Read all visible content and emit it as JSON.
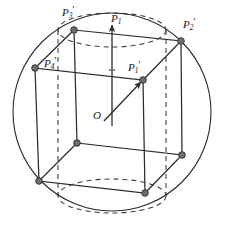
{
  "figure": {
    "background_color": "#ffffff",
    "stroke_color": "#2b2b2b",
    "vertex_fill_color": "#6e6e6e",
    "dash_color": "#3a3a3a",
    "width": 227,
    "height": 230
  },
  "labels": {
    "p3_prime": {
      "base": "P",
      "sub": "3",
      "prime": "'"
    },
    "p2_prime": {
      "base": "P",
      "sub": "2",
      "prime": "'"
    },
    "p4_prime": {
      "base": "P",
      "sub": "4",
      "prime": "'"
    },
    "p1_prime": {
      "base": "P",
      "sub": "1",
      "prime": "'"
    },
    "p1": {
      "base": "P",
      "sub": "1",
      "prime": ""
    },
    "origin": {
      "base": "O",
      "sub": "",
      "prime": ""
    }
  },
  "geometry": {
    "sphere": {
      "cx": 112,
      "cy": 112,
      "r": 99
    },
    "cylinder_ellipse": {
      "top": {
        "cx": 112,
        "cy": 30,
        "rx": 54,
        "ry": 17
      },
      "bottom": {
        "cx": 112,
        "cy": 196,
        "rx": 54,
        "ry": 17
      }
    },
    "cube_vertices": {
      "top_back_left": {
        "x": 74,
        "y": 30,
        "label": "p3_prime"
      },
      "top_back_right": {
        "x": 181,
        "y": 41,
        "label": "p2_prime"
      },
      "top_front_left": {
        "x": 35,
        "y": 68,
        "label": "p4_prime"
      },
      "top_front_right": {
        "x": 143,
        "y": 80,
        "label": "p1_prime"
      },
      "bottom_back_left": {
        "x": 77,
        "y": 143,
        "label": ""
      },
      "bottom_back_right": {
        "x": 182,
        "y": 155,
        "label": ""
      },
      "bottom_front_left": {
        "x": 39,
        "y": 181,
        "label": ""
      },
      "bottom_front_right": {
        "x": 145,
        "y": 193,
        "label": ""
      }
    },
    "origin_point": {
      "x": 112,
      "y": 112
    },
    "vectors": [
      {
        "name": "p1_axis_vector",
        "from": {
          "x": 112,
          "y": 112
        },
        "to": {
          "x": 112,
          "y": 24
        },
        "label": "p1"
      },
      {
        "name": "p1_prime_vector",
        "from": {
          "x": 112,
          "y": 112
        },
        "to": {
          "x": 143,
          "y": 80
        },
        "label": "p1_prime"
      }
    ]
  }
}
